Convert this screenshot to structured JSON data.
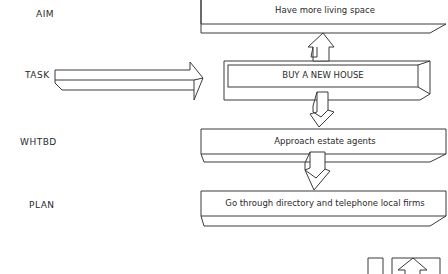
{
  "diagram": {
    "type": "hierarchy-flow",
    "rows": [
      {
        "id": "aim",
        "label": "AIM",
        "box_text": "Have more living space"
      },
      {
        "id": "task",
        "label": "TASK",
        "box_text": "BUY A NEW HOUSE"
      },
      {
        "id": "whtbd",
        "label": "WHTBD",
        "box_text": "Approach estate agents"
      },
      {
        "id": "plan",
        "label": "PLAN",
        "box_text": "Go through directory and telephone local firms"
      }
    ],
    "connectors": [
      {
        "from": "task",
        "to": "aim",
        "direction": "up"
      },
      {
        "from": "task",
        "to": "whtbd",
        "direction": "down"
      },
      {
        "from": "whtbd",
        "to": "plan",
        "direction": "down"
      },
      {
        "from": "task-label",
        "to": "task",
        "direction": "right"
      }
    ],
    "colors": {
      "line": "#3a3a3a",
      "background": "#ffffff",
      "text": "#2a2a2a"
    }
  }
}
